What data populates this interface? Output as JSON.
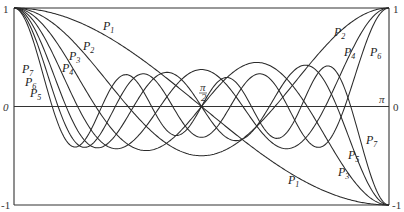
{
  "chart_data": {
    "type": "line",
    "title": "",
    "xlabel": "θ",
    "ylabel": "P_n(cos θ)",
    "xlim": [
      0,
      3.14159
    ],
    "ylim": [
      -1,
      1
    ],
    "grid": false,
    "legend": "inline labels on curves",
    "x_ticks": [
      {
        "value": 0,
        "label": "0"
      },
      {
        "value": 1.5708,
        "label": "π/2"
      },
      {
        "value": 3.14159,
        "label": "π"
      }
    ],
    "y_ticks_left": [
      {
        "value": 1,
        "label": "1"
      },
      {
        "value": 0,
        "label": "0"
      },
      {
        "value": -1,
        "label": "-1"
      }
    ],
    "y_ticks_right": [
      {
        "value": 1,
        "label": "1"
      },
      {
        "value": 0,
        "label": "0"
      },
      {
        "value": -1,
        "label": "-1"
      }
    ],
    "series": [
      {
        "name": "P1",
        "degree": 1,
        "start": 1,
        "end": -1
      },
      {
        "name": "P2",
        "degree": 2,
        "start": 1,
        "end": 1
      },
      {
        "name": "P3",
        "degree": 3,
        "start": 1,
        "end": -1
      },
      {
        "name": "P4",
        "degree": 4,
        "start": 1,
        "end": 1
      },
      {
        "name": "P5",
        "degree": 5,
        "start": 1,
        "end": -1
      },
      {
        "name": "P6",
        "degree": 6,
        "start": 1,
        "end": 1
      },
      {
        "name": "P7",
        "degree": 7,
        "start": 1,
        "end": -1
      }
    ],
    "annotations": [
      {
        "text": "P1",
        "sub": "1",
        "x": 103,
        "y": 30
      },
      {
        "text": "P2",
        "sub": "2",
        "x": 83,
        "y": 50
      },
      {
        "text": "P3",
        "sub": "3",
        "x": 69,
        "y": 60
      },
      {
        "text": "P4",
        "sub": "4",
        "x": 62,
        "y": 72
      },
      {
        "text": "P7",
        "sub": "7",
        "x": 22,
        "y": 73
      },
      {
        "text": "P6",
        "sub": "6",
        "x": 25,
        "y": 86
      },
      {
        "text": "P5",
        "sub": "5",
        "x": 30,
        "y": 97
      },
      {
        "text": "P2",
        "sub": "2",
        "x": 334,
        "y": 36
      },
      {
        "text": "P4",
        "sub": "4",
        "x": 344,
        "y": 56
      },
      {
        "text": "P6",
        "sub": "6",
        "x": 370,
        "y": 56
      },
      {
        "text": "P7",
        "sub": "7",
        "x": 366,
        "y": 144
      },
      {
        "text": "P5",
        "sub": "5",
        "x": 348,
        "y": 159
      },
      {
        "text": "P3",
        "sub": "3",
        "x": 338,
        "y": 176
      },
      {
        "text": "P1",
        "sub": "1",
        "x": 288,
        "y": 184
      }
    ]
  },
  "axis_labels": {
    "left_top": "1",
    "left_mid": "0",
    "left_bottom": "-1",
    "right_top": "1",
    "right_mid": "0",
    "right_bottom": "-1",
    "pi_half": "π",
    "pi_half_den": "2",
    "pi": "π"
  }
}
